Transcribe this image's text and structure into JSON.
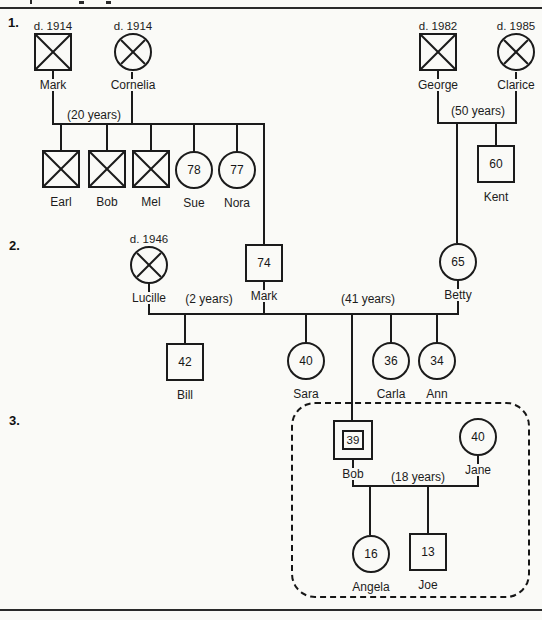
{
  "sections": [
    "1.",
    "2.",
    "3."
  ],
  "people": {
    "mark1": {
      "name": "Mark",
      "death": "d. 1914",
      "sex": "male",
      "deceased": true
    },
    "cornelia": {
      "name": "Cornelia",
      "death": "d. 1914",
      "sex": "female",
      "deceased": true
    },
    "george": {
      "name": "George",
      "death": "d. 1982",
      "sex": "male",
      "deceased": true
    },
    "clarice": {
      "name": "Clarice",
      "death": "d. 1985",
      "sex": "female",
      "deceased": true
    },
    "earl": {
      "name": "Earl",
      "sex": "male",
      "deceased": true
    },
    "bob1": {
      "name": "Bob",
      "sex": "male",
      "deceased": true
    },
    "mel": {
      "name": "Mel",
      "sex": "male",
      "deceased": true
    },
    "sue": {
      "name": "Sue",
      "sex": "female",
      "age": "78"
    },
    "nora": {
      "name": "Nora",
      "sex": "female",
      "age": "77"
    },
    "kent": {
      "name": "Kent",
      "sex": "male",
      "age": "60"
    },
    "lucille": {
      "name": "Lucille",
      "death": "d. 1946",
      "sex": "female",
      "deceased": true
    },
    "mark2": {
      "name": "Mark",
      "sex": "male",
      "age": "74"
    },
    "betty": {
      "name": "Betty",
      "sex": "female",
      "age": "65"
    },
    "bill": {
      "name": "Bill",
      "sex": "male",
      "age": "42"
    },
    "sara": {
      "name": "Sara",
      "sex": "female",
      "age": "40"
    },
    "carla": {
      "name": "Carla",
      "sex": "female",
      "age": "36"
    },
    "ann": {
      "name": "Ann",
      "sex": "female",
      "age": "34"
    },
    "bob3": {
      "name": "Bob",
      "sex": "male",
      "age": "39",
      "index_person": true
    },
    "jane": {
      "name": "Jane",
      "sex": "female",
      "age": "40"
    },
    "angela": {
      "name": "Angela",
      "sex": "female",
      "age": "16"
    },
    "joe": {
      "name": "Joe",
      "sex": "male",
      "age": "13"
    }
  },
  "marriages": {
    "mark_cornelia": {
      "label": "(20 years)",
      "children": [
        "Earl",
        "Bob",
        "Mel",
        "Sue",
        "Nora",
        "Mark"
      ]
    },
    "george_clarice": {
      "label": "(50 years)",
      "children": [
        "Betty",
        "Kent"
      ]
    },
    "lucille_mark": {
      "label": "(2 years)",
      "children": [
        "Bill"
      ]
    },
    "mark_betty": {
      "label": "(41 years)",
      "children": [
        "Sara",
        "Bob",
        "Carla",
        "Ann"
      ]
    },
    "bob_jane": {
      "label": "(18 years)",
      "children": [
        "Angela",
        "Joe"
      ]
    }
  }
}
